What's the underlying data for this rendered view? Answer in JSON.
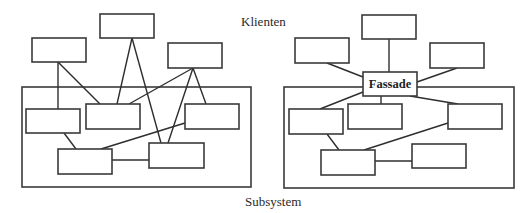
{
  "labels": {
    "clients": "Klienten",
    "subsystem": "Subsystem",
    "facade": "Fassade"
  },
  "colors": {
    "background": "#ffffff",
    "stroke": "#3a3a3a",
    "text": "#2a2a2a"
  },
  "left_diagram": {
    "description": "Clients directly coupled to many subsystem classes",
    "client_boxes": [
      {
        "id": "client-1",
        "x": 32,
        "y": 38,
        "w": 54,
        "h": 24
      },
      {
        "id": "client-2",
        "x": 100,
        "y": 14,
        "w": 54,
        "h": 24
      },
      {
        "id": "client-3",
        "x": 168,
        "y": 43,
        "w": 54,
        "h": 25
      }
    ],
    "subsystem_frame": {
      "x": 22,
      "y": 87,
      "w": 229,
      "h": 100
    },
    "subsystem_boxes": [
      {
        "id": "sub-1",
        "x": 26,
        "y": 109,
        "w": 54,
        "h": 24
      },
      {
        "id": "sub-2",
        "x": 86,
        "y": 104,
        "w": 54,
        "h": 25
      },
      {
        "id": "sub-3",
        "x": 185,
        "y": 104,
        "w": 54,
        "h": 25
      },
      {
        "id": "sub-4",
        "x": 58,
        "y": 149,
        "w": 54,
        "h": 25
      },
      {
        "id": "sub-5",
        "x": 149,
        "y": 143,
        "w": 55,
        "h": 25
      }
    ],
    "connections": [
      [
        "client-1",
        "sub-1"
      ],
      [
        "client-1",
        "sub-2"
      ],
      [
        "client-2",
        "sub-2"
      ],
      [
        "client-2",
        "sub-5"
      ],
      [
        "client-3",
        "sub-2"
      ],
      [
        "client-3",
        "sub-5"
      ],
      [
        "client-3",
        "sub-3"
      ],
      [
        "sub-1",
        "sub-4"
      ],
      [
        "sub-4",
        "sub-3"
      ],
      [
        "sub-4",
        "sub-5"
      ]
    ]
  },
  "right_diagram": {
    "description": "Clients coupled only to a single Facade which delegates to subsystem classes",
    "client_boxes": [
      {
        "id": "client-1",
        "x": 295,
        "y": 38,
        "w": 54,
        "h": 25
      },
      {
        "id": "client-2",
        "x": 362,
        "y": 15,
        "w": 54,
        "h": 24
      },
      {
        "id": "client-3",
        "x": 430,
        "y": 43,
        "w": 54,
        "h": 25
      }
    ],
    "facade_box": {
      "id": "facade",
      "label": "Fassade",
      "x": 363,
      "y": 72,
      "w": 54,
      "h": 24
    },
    "subsystem_frame": {
      "x": 284,
      "y": 87,
      "w": 230,
      "h": 101
    },
    "subsystem_boxes": [
      {
        "id": "sub-1",
        "x": 289,
        "y": 109,
        "w": 54,
        "h": 25
      },
      {
        "id": "sub-2",
        "x": 348,
        "y": 104,
        "w": 54,
        "h": 25
      },
      {
        "id": "sub-3",
        "x": 448,
        "y": 104,
        "w": 54,
        "h": 25
      },
      {
        "id": "sub-4",
        "x": 321,
        "y": 150,
        "w": 54,
        "h": 25
      },
      {
        "id": "sub-5",
        "x": 412,
        "y": 144,
        "w": 54,
        "h": 24
      }
    ],
    "connections": [
      [
        "client-1",
        "facade"
      ],
      [
        "client-2",
        "facade"
      ],
      [
        "client-3",
        "facade"
      ],
      [
        "facade",
        "sub-1"
      ],
      [
        "facade",
        "sub-2"
      ],
      [
        "facade",
        "sub-3"
      ],
      [
        "sub-1",
        "sub-4"
      ],
      [
        "sub-4",
        "sub-3"
      ],
      [
        "sub-4",
        "sub-5"
      ]
    ]
  }
}
